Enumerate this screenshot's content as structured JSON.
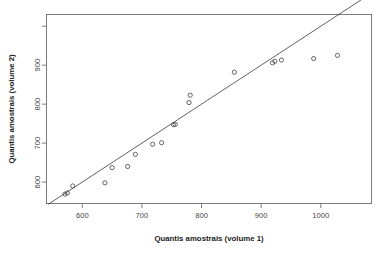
{
  "chart_data": {
    "type": "scatter",
    "title": "",
    "xlabel": "Quantis amostrais (volume 1)",
    "ylabel": "Quantis amostrais (volume 2)",
    "xlim": [
      540,
      1085
    ],
    "ylim": [
      545,
      1030
    ],
    "xticks": [
      600,
      700,
      800,
      900,
      1000
    ],
    "yticks": [
      600,
      700,
      800,
      900
    ],
    "xtick_labels": [
      "600",
      "700",
      "800",
      "900",
      "1000"
    ],
    "ytick_labels": [
      "600",
      "700",
      "800",
      "900"
    ],
    "grid": false,
    "legend": null,
    "annotations": [],
    "reference_line": {
      "name": "identity-line",
      "type": "line",
      "slope": 1,
      "intercept": 0,
      "x_from": 543,
      "y_from": 543,
      "x_to": 1082,
      "y_to": 1082
    },
    "series": [
      {
        "name": "quantis-amostrais",
        "marker": "open-circle",
        "points": [
          {
            "x": 571,
            "y": 569
          },
          {
            "x": 575,
            "y": 572
          },
          {
            "x": 584,
            "y": 590
          },
          {
            "x": 638,
            "y": 598
          },
          {
            "x": 650,
            "y": 637
          },
          {
            "x": 676,
            "y": 640
          },
          {
            "x": 689,
            "y": 671
          },
          {
            "x": 718,
            "y": 697
          },
          {
            "x": 733,
            "y": 701
          },
          {
            "x": 753,
            "y": 747
          },
          {
            "x": 756,
            "y": 748
          },
          {
            "x": 779,
            "y": 804
          },
          {
            "x": 781,
            "y": 823
          },
          {
            "x": 855,
            "y": 882
          },
          {
            "x": 919,
            "y": 906
          },
          {
            "x": 923,
            "y": 910
          },
          {
            "x": 934,
            "y": 913
          },
          {
            "x": 988,
            "y": 917
          },
          {
            "x": 1028,
            "y": 925
          }
        ]
      }
    ]
  }
}
